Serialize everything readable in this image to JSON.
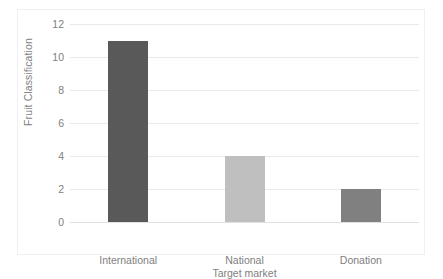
{
  "chart_data": {
    "type": "bar",
    "title": "",
    "xlabel": "Target market",
    "ylabel": "Fruit Classification",
    "categories": [
      "International",
      "National",
      "Donation"
    ],
    "values": [
      11,
      4,
      2
    ],
    "series": [
      {
        "name": "Fruit Classification",
        "values": [
          11,
          4,
          2
        ]
      }
    ],
    "bar_colors": [
      "#595959",
      "#bfbfbf",
      "#808080"
    ],
    "ylim": [
      0,
      12
    ],
    "ytick_labels": [
      "12",
      "10",
      "8",
      "6",
      "4",
      "2",
      "0"
    ],
    "ytick_values": [
      12,
      10,
      8,
      6,
      4,
      2,
      0
    ],
    "grid": true,
    "legend": false,
    "axis_text_color": "#808080",
    "gridline_color": "#e9e9e9",
    "plot_background": "#ffffff",
    "frame_color": "#f0f0f0"
  }
}
